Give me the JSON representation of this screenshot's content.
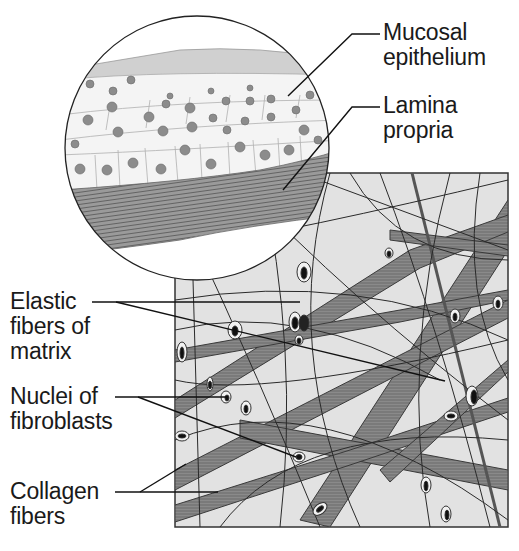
{
  "figure": {
    "colors": {
      "background": "#ffffff",
      "line": "#1a1a1a",
      "panel_fill": "#e4e4e4",
      "collagen": "#7a7a7a",
      "elastic": "#2a2a2a",
      "cell_fill": "#f4f4f4",
      "cell_nucleus": "#8a8a8a",
      "lamina": "#8c8c8c"
    }
  },
  "labels": {
    "mucosal_epithelium": {
      "line1": "Mucosal",
      "line2": "epithelium"
    },
    "lamina_propria": {
      "line1": "Lamina",
      "line2": "propria"
    },
    "elastic_fibers": {
      "line1": "Elastic",
      "line2": "fibers of",
      "line3": "matrix"
    },
    "nuclei_fibroblasts": {
      "line1": "Nuclei of",
      "line2": "fibroblasts"
    },
    "collagen_fibers": {
      "line1": "Collagen",
      "line2": "fibers"
    }
  }
}
